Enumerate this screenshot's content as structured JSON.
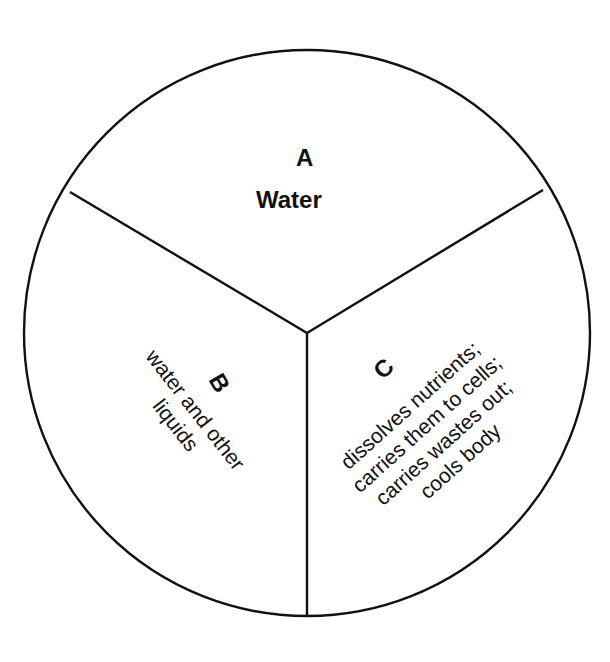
{
  "diagram": {
    "type": "circle divided into three sectors",
    "colors": {
      "stroke": "#111111",
      "background": "#ffffff",
      "text": "#111111"
    },
    "sectors": [
      {
        "id": "A",
        "letter": "A",
        "text": "Water",
        "position": "top"
      },
      {
        "id": "B",
        "letter": "B",
        "lines": [
          "water and other",
          "liquids"
        ],
        "position": "bottom-left"
      },
      {
        "id": "C",
        "letter": "C",
        "lines": [
          "dissolves nutrients;",
          "carries them to cells;",
          "carries wastes out;",
          "cools body"
        ],
        "position": "bottom-right"
      }
    ]
  }
}
